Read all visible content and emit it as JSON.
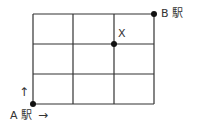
{
  "diagram": {
    "type": "street-grid",
    "columns": 3,
    "rows": 3,
    "line_color": "#333333",
    "dot_color": "#111111",
    "labels": {
      "start": "A 駅",
      "end": "B 駅",
      "point_x": "X",
      "arrow_up": "↑",
      "arrow_right": "→"
    },
    "points": [
      {
        "name": "A駅",
        "grid": [
          0,
          0
        ]
      },
      {
        "name": "X",
        "grid": [
          2,
          2
        ]
      },
      {
        "name": "B駅",
        "grid": [
          3,
          3
        ]
      }
    ]
  }
}
